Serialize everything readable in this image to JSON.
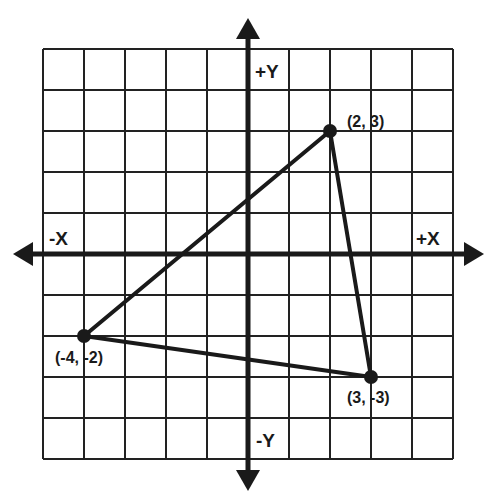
{
  "diagram": {
    "type": "coordinate-plane",
    "grid": {
      "x_min": -5,
      "x_max": 5,
      "y_min": -5,
      "y_max": 5,
      "cell_px": 41,
      "origin_px": [
        248,
        254
      ],
      "line_color": "#222222",
      "background": "#ffffff"
    },
    "axes": {
      "color": "#1a1a1a",
      "labels": {
        "pos_x": "+X",
        "neg_x": "-X",
        "pos_y": "+Y",
        "neg_y": "-Y"
      }
    },
    "triangle": {
      "color": "#1a1a1a",
      "vertices": [
        {
          "x": 2,
          "y": 3,
          "label": "(2, 3)"
        },
        {
          "x": -4,
          "y": -2,
          "label": "(-4, -2)"
        },
        {
          "x": 3,
          "y": -3,
          "label": "(3, -3)"
        }
      ]
    }
  }
}
